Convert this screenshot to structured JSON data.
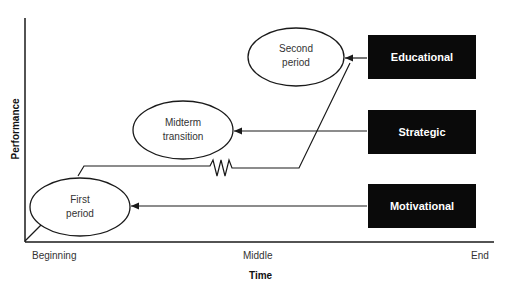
{
  "diagram": {
    "axes": {
      "y_title": "Performance",
      "x_title": "Time",
      "x_ticks": [
        "Beginning",
        "Middle",
        "End"
      ]
    },
    "stages": [
      {
        "id": "first",
        "line1": "First",
        "line2": "period"
      },
      {
        "id": "midterm",
        "line1": "Midterm",
        "line2": "transition"
      },
      {
        "id": "second",
        "line1": "Second",
        "line2": "period"
      }
    ],
    "drivers": [
      {
        "id": "educational",
        "label": "Educational",
        "targets": "second"
      },
      {
        "id": "strategic",
        "label": "Strategic",
        "targets": "midterm"
      },
      {
        "id": "motivational",
        "label": "Motivational",
        "targets": "first"
      }
    ],
    "colors": {
      "box_fill": "#0a0a0a",
      "box_text": "#ffffff",
      "line": "#1a1a1a"
    }
  }
}
